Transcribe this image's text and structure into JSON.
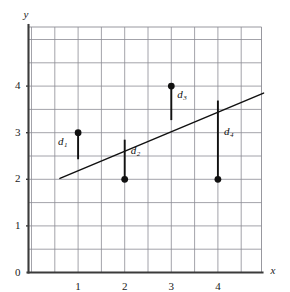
{
  "figure": {
    "background_color": "#ffffff",
    "grid_color": "#8c8c94",
    "axis_color": "#3b3b3b",
    "data_color": "#111111",
    "line_color": "#111111"
  },
  "axes": {
    "x_label": "x",
    "y_label": "y",
    "origin_label": "0",
    "x_ticks": [
      "1",
      "2",
      "3",
      "4"
    ],
    "y_ticks": [
      "1",
      "2",
      "3",
      "4"
    ],
    "x_tick_values": [
      1,
      2,
      3,
      4
    ],
    "y_tick_values": [
      1,
      2,
      3,
      4
    ],
    "xlim": [
      -0.07,
      5.0
    ],
    "ylim": [
      0,
      5.3
    ],
    "grid": true,
    "grid_step": 0.5
  },
  "chart_data": {
    "type": "scatter",
    "title": "",
    "xlabel": "x",
    "ylabel": "y",
    "xlim": [
      -0.07,
      5.0
    ],
    "ylim": [
      0,
      5.3
    ],
    "grid": true,
    "grid_step": 0.5,
    "legend": "none",
    "x": [
      1,
      2,
      3,
      4
    ],
    "y": [
      3,
      2,
      4,
      2
    ],
    "points": [
      {
        "label": "d",
        "subscript": "1",
        "x": 1,
        "y": 3,
        "fit_y": 2.43,
        "label_side": "left"
      },
      {
        "label": "d",
        "subscript": "2",
        "x": 2,
        "y": 2,
        "fit_y": 2.85,
        "label_side": "right"
      },
      {
        "label": "d",
        "subscript": "3",
        "x": 3,
        "y": 4,
        "fit_y": 3.27,
        "label_side": "right"
      },
      {
        "label": "d",
        "subscript": "4",
        "x": 4,
        "y": 2,
        "fit_y": 3.69,
        "label_side": "right"
      }
    ],
    "fit_line": {
      "name": "least-squares line",
      "x_start": 0.61,
      "y_start": 2.02,
      "x_end": 4.98,
      "y_end": 3.85,
      "slope": 0.419,
      "intercept": 2.165
    },
    "residual_labels": [
      "d1",
      "d2",
      "d3",
      "d4"
    ]
  }
}
